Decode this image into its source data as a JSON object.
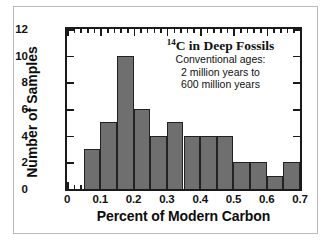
{
  "chart_data": {
    "type": "bar",
    "title": "14C in Deep Fossils",
    "title_isotope_sup": "14",
    "title_rest": "C in Deep Fossils",
    "annotation_lines": [
      "Conventional ages:",
      "2 million years to",
      "600 million years"
    ],
    "xlabel": "Percent of Modern Carbon",
    "ylabel": "Number of Samples",
    "xlim": [
      0,
      0.7
    ],
    "ylim": [
      0,
      12
    ],
    "x_major_ticks": [
      0,
      0.1,
      0.2,
      0.3,
      0.4,
      0.5,
      0.6,
      0.7
    ],
    "x_tick_labels": [
      "0",
      "0.1",
      "0.2",
      "0.3",
      "0.4",
      "0.5",
      "0.6",
      "0.7"
    ],
    "x_minor_tick_step": 0.02,
    "y_major_ticks": [
      0,
      2,
      4,
      6,
      8,
      10,
      12
    ],
    "y_tick_labels": [
      "0",
      "2",
      "4",
      "6",
      "8",
      "10",
      "12"
    ],
    "bin_width": 0.05,
    "bin_starts": [
      0.05,
      0.1,
      0.15,
      0.2,
      0.25,
      0.3,
      0.35,
      0.4,
      0.45,
      0.5,
      0.55,
      0.6,
      0.65
    ],
    "bin_edges": [
      0.05,
      0.1,
      0.15,
      0.2,
      0.25,
      0.3,
      0.35,
      0.4,
      0.45,
      0.5,
      0.55,
      0.6,
      0.65,
      0.7
    ],
    "categories": [
      "0.05-0.10",
      "0.10-0.15",
      "0.15-0.20",
      "0.20-0.25",
      "0.25-0.30",
      "0.30-0.35",
      "0.35-0.40",
      "0.40-0.45",
      "0.45-0.50",
      "0.50-0.55",
      "0.55-0.60",
      "0.60-0.65",
      "0.65-0.70"
    ],
    "values": [
      3,
      5,
      10,
      6,
      4,
      5,
      4,
      4,
      4,
      2,
      2,
      1,
      2
    ],
    "grid": false,
    "legend": false,
    "bar_fill_color": "#6f6f6f",
    "bar_edge_color": "#222222",
    "axis_color": "#1a1a1a",
    "background_color": "#ffffff"
  }
}
